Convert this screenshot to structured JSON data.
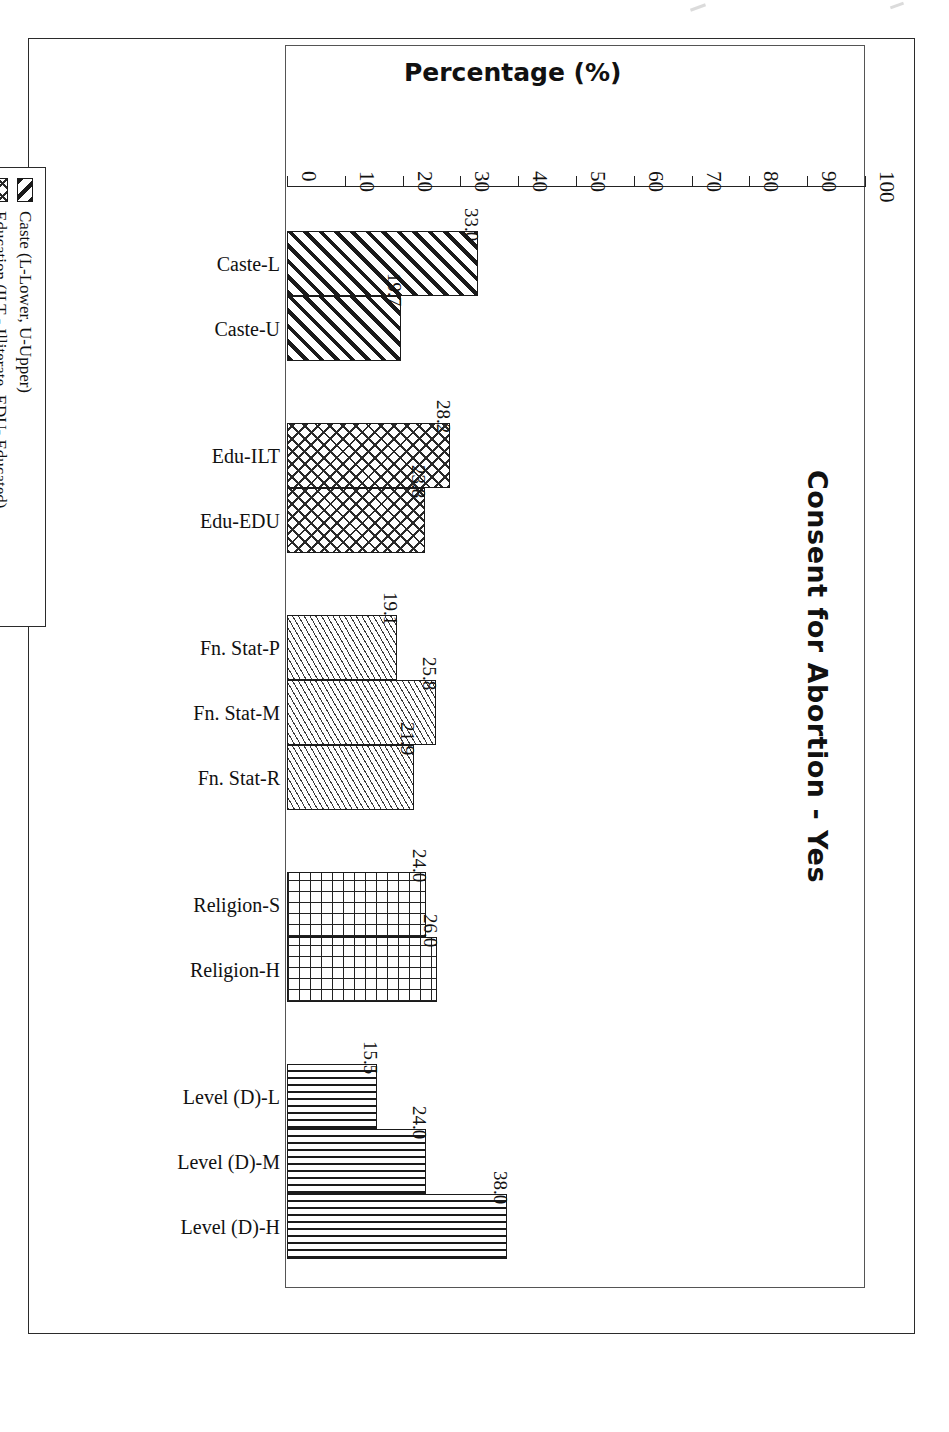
{
  "chart_data": {
    "type": "bar",
    "orientation": "horizontal",
    "title": "Consent for Abortion - Yes",
    "xlabel": "Percentage (%)",
    "ylabel": "",
    "axis_title": "Percentage (%)",
    "xlim": [
      0,
      100
    ],
    "xticks": [
      0,
      10,
      20,
      30,
      40,
      50,
      60,
      70,
      80,
      90,
      100
    ],
    "tick_labels": [
      "0",
      "10",
      "20",
      "30",
      "40",
      "50",
      "60",
      "70",
      "80",
      "90",
      "100"
    ],
    "grid": false,
    "legend_position": "left",
    "categories": [
      "Caste-L",
      "Caste-U",
      "Edu-ILT",
      "Edu-EDU",
      "Fn. Stat-P",
      "Fn. Stat-M",
      "Fn. Stat-R",
      "Religion-S",
      "Religion-H",
      "Level (D)-L",
      "Level (D)-M",
      "Level (D)-H"
    ],
    "values": [
      33.0,
      19.7,
      28.2,
      23.8,
      19.1,
      25.8,
      21.9,
      24.0,
      26.0,
      15.5,
      24.0,
      38.0
    ],
    "value_labels": [
      "33.0",
      "19.7",
      "28.2",
      "23.8",
      "19.1",
      "25.8",
      "21.9",
      "24.0",
      "26.0",
      "15.5",
      "24.0",
      "38.0"
    ],
    "groups": [
      {
        "name": "Caste",
        "pattern": "diagonal-stripes",
        "bars": [
          {
            "category": "Caste-L",
            "value": 33.0,
            "label": "33.0"
          },
          {
            "category": "Caste-U",
            "value": 19.7,
            "label": "19.7"
          }
        ]
      },
      {
        "name": "Education",
        "pattern": "cross-diagonal",
        "bars": [
          {
            "category": "Edu-ILT",
            "value": 28.2,
            "label": "28.2"
          },
          {
            "category": "Edu-EDU",
            "value": 23.8,
            "label": "23.8"
          }
        ]
      },
      {
        "name": "Financial Status",
        "pattern": "fine-diagonal",
        "bars": [
          {
            "category": "Fn. Stat-P",
            "value": 19.1,
            "label": "19.1"
          },
          {
            "category": "Fn. Stat-M",
            "value": 25.8,
            "label": "25.8"
          },
          {
            "category": "Fn. Stat-R",
            "value": 21.9,
            "label": "21.9"
          }
        ]
      },
      {
        "name": "Religion",
        "pattern": "grid",
        "bars": [
          {
            "category": "Religion-S",
            "value": 24.0,
            "label": "24.0"
          },
          {
            "category": "Religion-H",
            "value": 26.0,
            "label": "26.0"
          }
        ]
      },
      {
        "name": "Level of Decision",
        "pattern": "horizontal-lines",
        "bars": [
          {
            "category": "Level (D)-L",
            "value": 15.5,
            "label": "15.5"
          },
          {
            "category": "Level (D)-M",
            "value": 24.0,
            "label": "24.0"
          },
          {
            "category": "Level (D)-H",
            "value": 38.0,
            "label": "38.0"
          }
        ]
      }
    ],
    "legend": [
      {
        "label": "Caste (L-Lower, U-Upper)",
        "pattern": "diagonal-stripes"
      },
      {
        "label": "Education (ILT - Illiterate, EDU- Educated)",
        "pattern": "cross-diagonal"
      },
      {
        "label": "Financial Status (P-Poor, M-Middle, R-Rich)",
        "pattern": "fine-diagonal"
      },
      {
        "label": "Religion (S-Sikh, H-Hindu)",
        "pattern": "grid"
      },
      {
        "label": "Level of Decision (L-Low, M-Middle, H-High)",
        "pattern": "horizontal-lines"
      }
    ]
  }
}
